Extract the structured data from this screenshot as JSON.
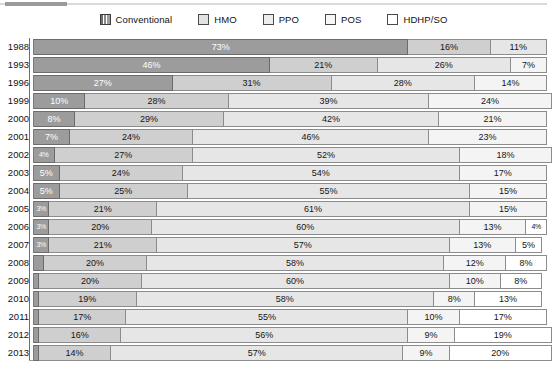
{
  "legend": {
    "items": [
      {
        "label": "Conventional",
        "icon": "swatch-conventional",
        "color": "#9c9c9c"
      },
      {
        "label": "HMO",
        "icon": "swatch-hmo",
        "color": "#cfcfcf"
      },
      {
        "label": "PPO",
        "icon": "swatch-ppo",
        "color": "#e6e6e6"
      },
      {
        "label": "POS",
        "icon": "swatch-pos",
        "color": "#f4f4f4"
      },
      {
        "label": "HDHP/SO",
        "icon": "swatch-hdhp",
        "color": "#ffffff"
      }
    ]
  },
  "chart_data": {
    "type": "bar",
    "orientation": "horizontal",
    "stacked": true,
    "title": "",
    "xlabel": "",
    "ylabel": "",
    "xlim": [
      0,
      100
    ],
    "grid": false,
    "legend_position": "top-center",
    "categories": [
      "1988",
      "1993",
      "1996",
      "1999",
      "2000",
      "2001",
      "2002",
      "2003",
      "2004",
      "2005",
      "2006",
      "2007",
      "2008",
      "2009",
      "2010",
      "2011",
      "2012",
      "2013"
    ],
    "series": [
      {
        "name": "Conventional",
        "values": [
          73,
          46,
          27,
          10,
          8,
          7,
          4,
          5,
          5,
          3,
          3,
          3,
          2,
          1,
          1,
          1,
          1,
          1
        ]
      },
      {
        "name": "HMO",
        "values": [
          16,
          21,
          31,
          28,
          29,
          24,
          27,
          24,
          25,
          21,
          20,
          21,
          20,
          20,
          19,
          17,
          16,
          14
        ]
      },
      {
        "name": "PPO",
        "values": [
          11,
          26,
          28,
          39,
          42,
          46,
          52,
          54,
          55,
          61,
          60,
          57,
          58,
          60,
          58,
          55,
          56,
          57
        ]
      },
      {
        "name": "POS",
        "values": [
          0,
          7,
          14,
          24,
          21,
          23,
          18,
          17,
          15,
          15,
          13,
          13,
          12,
          10,
          8,
          10,
          9,
          9
        ]
      },
      {
        "name": "HDHP/SO",
        "values": [
          0,
          0,
          0,
          0,
          0,
          0,
          0,
          0,
          0,
          0,
          4,
          5,
          8,
          8,
          13,
          17,
          19,
          20
        ]
      }
    ],
    "rows": [
      {
        "year": "1988",
        "segments": [
          {
            "type": "conventional",
            "value": 73,
            "label": "73%"
          },
          {
            "type": "hmo",
            "value": 16,
            "label": "16%"
          },
          {
            "type": "ppo",
            "value": 11,
            "label": "11%"
          }
        ]
      },
      {
        "year": "1993",
        "segments": [
          {
            "type": "conventional",
            "value": 46,
            "label": "46%"
          },
          {
            "type": "hmo",
            "value": 21,
            "label": "21%"
          },
          {
            "type": "ppo",
            "value": 26,
            "label": "26%"
          },
          {
            "type": "pos",
            "value": 7,
            "label": "7%"
          }
        ]
      },
      {
        "year": "1996",
        "segments": [
          {
            "type": "conventional",
            "value": 27,
            "label": "27%"
          },
          {
            "type": "hmo",
            "value": 31,
            "label": "31%"
          },
          {
            "type": "ppo",
            "value": 28,
            "label": "28%"
          },
          {
            "type": "pos",
            "value": 14,
            "label": "14%"
          }
        ]
      },
      {
        "year": "1999",
        "segments": [
          {
            "type": "conventional",
            "value": 10,
            "label": "10%"
          },
          {
            "type": "hmo",
            "value": 28,
            "label": "28%"
          },
          {
            "type": "ppo",
            "value": 39,
            "label": "39%"
          },
          {
            "type": "pos",
            "value": 24,
            "label": "24%"
          }
        ]
      },
      {
        "year": "2000",
        "segments": [
          {
            "type": "conventional",
            "value": 8,
            "label": "8%"
          },
          {
            "type": "hmo",
            "value": 29,
            "label": "29%"
          },
          {
            "type": "ppo",
            "value": 42,
            "label": "42%"
          },
          {
            "type": "pos",
            "value": 21,
            "label": "21%"
          }
        ]
      },
      {
        "year": "2001",
        "segments": [
          {
            "type": "conventional",
            "value": 7,
            "label": "7%"
          },
          {
            "type": "hmo",
            "value": 24,
            "label": "24%"
          },
          {
            "type": "ppo",
            "value": 46,
            "label": "46%"
          },
          {
            "type": "pos",
            "value": 23,
            "label": "23%"
          }
        ]
      },
      {
        "year": "2002",
        "segments": [
          {
            "type": "conventional",
            "value": 4,
            "label": "4%"
          },
          {
            "type": "hmo",
            "value": 27,
            "label": "27%"
          },
          {
            "type": "ppo",
            "value": 52,
            "label": "52%"
          },
          {
            "type": "pos",
            "value": 18,
            "label": "18%"
          }
        ]
      },
      {
        "year": "2003",
        "segments": [
          {
            "type": "conventional",
            "value": 5,
            "label": "5%"
          },
          {
            "type": "hmo",
            "value": 24,
            "label": "24%"
          },
          {
            "type": "ppo",
            "value": 54,
            "label": "54%"
          },
          {
            "type": "pos",
            "value": 17,
            "label": "17%"
          }
        ]
      },
      {
        "year": "2004",
        "segments": [
          {
            "type": "conventional",
            "value": 5,
            "label": "5%"
          },
          {
            "type": "hmo",
            "value": 25,
            "label": "25%"
          },
          {
            "type": "ppo",
            "value": 55,
            "label": "55%"
          },
          {
            "type": "pos",
            "value": 15,
            "label": "15%"
          }
        ]
      },
      {
        "year": "2005",
        "segments": [
          {
            "type": "conventional",
            "value": 3,
            "label": "3%"
          },
          {
            "type": "hmo",
            "value": 21,
            "label": "21%"
          },
          {
            "type": "ppo",
            "value": 61,
            "label": "61%"
          },
          {
            "type": "pos",
            "value": 15,
            "label": "15%"
          }
        ]
      },
      {
        "year": "2006",
        "segments": [
          {
            "type": "conventional",
            "value": 3,
            "label": "3%"
          },
          {
            "type": "hmo",
            "value": 20,
            "label": "20%"
          },
          {
            "type": "ppo",
            "value": 60,
            "label": "60%"
          },
          {
            "type": "pos",
            "value": 13,
            "label": "13%"
          },
          {
            "type": "hdhp",
            "value": 4,
            "label": "4%"
          }
        ]
      },
      {
        "year": "2007",
        "segments": [
          {
            "type": "conventional",
            "value": 3,
            "label": "3%"
          },
          {
            "type": "hmo",
            "value": 21,
            "label": "21%"
          },
          {
            "type": "ppo",
            "value": 57,
            "label": "57%"
          },
          {
            "type": "pos",
            "value": 13,
            "label": "13%"
          },
          {
            "type": "hdhp",
            "value": 5,
            "label": "5%"
          }
        ]
      },
      {
        "year": "2008",
        "segments": [
          {
            "type": "conventional",
            "value": 2,
            "label": "2%"
          },
          {
            "type": "hmo",
            "value": 20,
            "label": "20%"
          },
          {
            "type": "ppo",
            "value": 58,
            "label": "58%"
          },
          {
            "type": "pos",
            "value": 12,
            "label": "12%"
          },
          {
            "type": "hdhp",
            "value": 8,
            "label": "8%"
          }
        ]
      },
      {
        "year": "2009",
        "segments": [
          {
            "type": "conventional",
            "value": 1,
            "label": "1%"
          },
          {
            "type": "hmo",
            "value": 20,
            "label": "20%"
          },
          {
            "type": "ppo",
            "value": 60,
            "label": "60%"
          },
          {
            "type": "pos",
            "value": 10,
            "label": "10%"
          },
          {
            "type": "hdhp",
            "value": 8,
            "label": "8%"
          }
        ]
      },
      {
        "year": "2010",
        "segments": [
          {
            "type": "conventional",
            "value": 1,
            "label": "1%"
          },
          {
            "type": "hmo",
            "value": 19,
            "label": "19%"
          },
          {
            "type": "ppo",
            "value": 58,
            "label": "58%"
          },
          {
            "type": "pos",
            "value": 8,
            "label": "8%"
          },
          {
            "type": "hdhp",
            "value": 13,
            "label": "13%"
          }
        ]
      },
      {
        "year": "2011",
        "segments": [
          {
            "type": "conventional",
            "value": 1,
            "label": "1%"
          },
          {
            "type": "hmo",
            "value": 17,
            "label": "17%"
          },
          {
            "type": "ppo",
            "value": 55,
            "label": "55%"
          },
          {
            "type": "pos",
            "value": 10,
            "label": "10%"
          },
          {
            "type": "hdhp",
            "value": 17,
            "label": "17%"
          }
        ]
      },
      {
        "year": "2012",
        "segments": [
          {
            "type": "conventional",
            "value": 1,
            "label": "1%"
          },
          {
            "type": "hmo",
            "value": 16,
            "label": "16%"
          },
          {
            "type": "ppo",
            "value": 56,
            "label": "56%"
          },
          {
            "type": "pos",
            "value": 9,
            "label": "9%"
          },
          {
            "type": "hdhp",
            "value": 19,
            "label": "19%"
          }
        ]
      },
      {
        "year": "2013",
        "segments": [
          {
            "type": "conventional",
            "value": 1,
            "label": "1%"
          },
          {
            "type": "hmo",
            "value": 14,
            "label": "14%"
          },
          {
            "type": "ppo",
            "value": 57,
            "label": "57%"
          },
          {
            "type": "pos",
            "value": 9,
            "label": "9%"
          },
          {
            "type": "hdhp",
            "value": 20,
            "label": "20%"
          }
        ]
      }
    ]
  }
}
